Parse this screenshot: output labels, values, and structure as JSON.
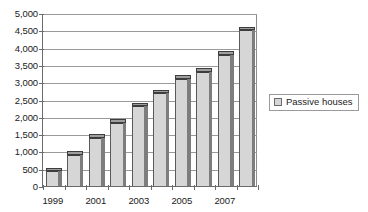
{
  "chart_data": {
    "type": "bar",
    "title": "",
    "subtitle": "",
    "xlabel": "",
    "ylabel": "",
    "categories": [
      "1999",
      "2000",
      "2001",
      "2002",
      "2003",
      "2004",
      "2005",
      "2006",
      "2007",
      "2008"
    ],
    "values": [
      430,
      900,
      1400,
      1830,
      2300,
      2680,
      3100,
      3300,
      3800,
      4500
    ],
    "series": [
      {
        "name": "Passive houses",
        "values": [
          430,
          900,
          1400,
          1830,
          2300,
          2680,
          3100,
          3300,
          3800,
          4500
        ]
      }
    ],
    "ylim": [
      0,
      5000
    ],
    "ytick_values": [
      0,
      500,
      1000,
      1500,
      2000,
      2500,
      3000,
      3500,
      4000,
      4500,
      5000
    ],
    "ytick_labels": [
      "0",
      "500",
      "1,000",
      "1,500",
      "2,000",
      "2,500",
      "3,000",
      "3,500",
      "4,000",
      "4,500",
      "5,000"
    ],
    "xtick_labels": [
      "1999",
      "2001",
      "2003",
      "2005",
      "2007"
    ],
    "xtick_categories": [
      "1999",
      "2001",
      "2003",
      "2005",
      "2007"
    ],
    "grid": true,
    "grid_axis": "y",
    "legend_position": "right",
    "colors": {
      "bar_face": "#d6d6d6",
      "bar_side": "#7d7d7d",
      "bar_top": "#9e9e9e",
      "bar_outline": "#3d3d3d",
      "gridline": "#9a9a9a",
      "axis": "#6b6b6b",
      "text": "#1a1a1a",
      "background": "#ffffff"
    }
  },
  "legend": {
    "items": [
      {
        "label": "Passive houses",
        "swatch_color": "#d6d6d6"
      }
    ]
  }
}
